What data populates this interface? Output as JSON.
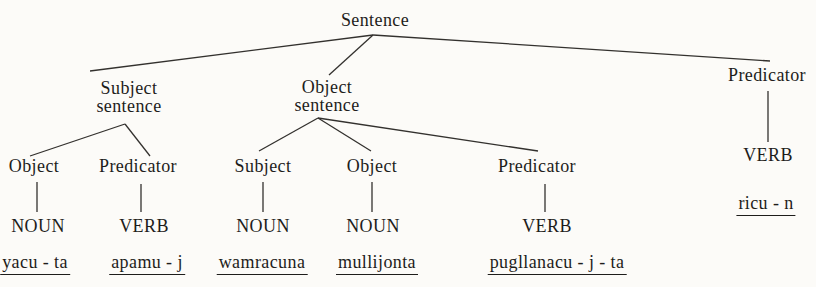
{
  "colors": {
    "paper": "#fcfbf8",
    "ink": "#1e1d1b",
    "line": "#33312e"
  },
  "tree": {
    "root": {
      "label": "Sentence"
    },
    "subject_sentence": {
      "line1": "Subject",
      "line2": "sentence"
    },
    "object_sentence": {
      "line1": "Object",
      "line2": "sentence"
    },
    "predicator_right": {
      "label": "Predicator",
      "pos": "VERB",
      "word": "ricu - n"
    },
    "subject_clause": {
      "object": {
        "label": "Object",
        "pos": "NOUN",
        "word": "yacu - ta"
      },
      "predicator": {
        "label": "Predicator",
        "pos": "VERB",
        "word": "apamu - j"
      }
    },
    "object_clause": {
      "subject": {
        "label": "Subject",
        "pos": "NOUN",
        "word": "wamracuna"
      },
      "object": {
        "label": "Object",
        "pos": "NOUN",
        "word": "mullijonta"
      },
      "predicator": {
        "label": "Predicator",
        "pos": "VERB",
        "word": "pugllanacu - j - ta"
      }
    }
  }
}
